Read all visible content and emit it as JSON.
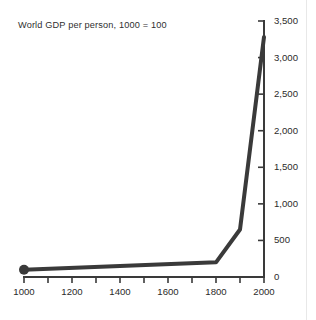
{
  "chart_data": {
    "type": "line",
    "title": "World GDP per person, 1000 = 100",
    "xlabel": "",
    "ylabel": "",
    "xlim": [
      1000,
      2000
    ],
    "ylim": [
      0,
      3500
    ],
    "grid": false,
    "legend": "none",
    "y_axis_position": "right",
    "x": [
      1000,
      1800,
      1900,
      2000
    ],
    "values": [
      100,
      200,
      650,
      3280
    ],
    "series": [
      {
        "name": "World GDP per person, 1000 = 100",
        "x": [
          1000,
          1800,
          1900,
          2000
        ],
        "values": [
          100,
          200,
          650,
          3280
        ],
        "color": "#3a3a3a",
        "line_width": 4,
        "markers": [
          {
            "x": 1000,
            "y": 100,
            "shape": "circle",
            "radius": 5
          }
        ]
      }
    ],
    "x_tick_values": [
      1000,
      1100,
      1200,
      1300,
      1400,
      1500,
      1600,
      1700,
      1800,
      1900,
      2000
    ],
    "x_tick_labels": [
      {
        "value": 1000,
        "label": "1000"
      },
      {
        "value": 1200,
        "label": "1200"
      },
      {
        "value": 1400,
        "label": "1400"
      },
      {
        "value": 1600,
        "label": "1600"
      },
      {
        "value": 1800,
        "label": "1800"
      },
      {
        "value": 2000,
        "label": "2000"
      }
    ],
    "y_tick_labels": [
      {
        "value": 0,
        "label": "0"
      },
      {
        "value": 500,
        "label": "500"
      },
      {
        "value": 1000,
        "label": "1,000"
      },
      {
        "value": 1500,
        "label": "1,500"
      },
      {
        "value": 2000,
        "label": "2,000"
      },
      {
        "value": 2500,
        "label": "2,500"
      },
      {
        "value": 3000,
        "label": "3,000"
      },
      {
        "value": 3500,
        "label": "3,500"
      }
    ],
    "colors": {
      "line": "#3a3a3a",
      "axis": "#3a3a3a",
      "text": "#2b2b2b",
      "background": "#ffffff"
    }
  }
}
